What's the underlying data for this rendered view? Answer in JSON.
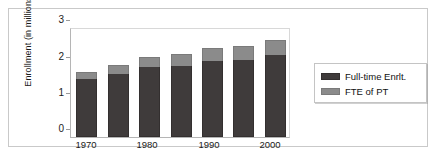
{
  "chart_data": {
    "type": "bar",
    "stacked": true,
    "title": "",
    "xlabel": "",
    "ylabel": "Enrollment (in millions)",
    "ylim": [
      0,
      3
    ],
    "yticks": [
      0,
      1,
      2,
      3
    ],
    "ytick_labels": [
      "0",
      "1",
      "2",
      "3"
    ],
    "grid": false,
    "legend_position": "right",
    "categories": [
      "1970",
      "1975",
      "1980",
      "1985",
      "1990",
      "1995",
      "2000"
    ],
    "xtick_labels": [
      "1970",
      "1980",
      "1990",
      "2000"
    ],
    "xtick_categories": [
      "1970",
      "1980",
      "1990",
      "2000"
    ],
    "series": [
      {
        "name": "Full-time Enrlt.",
        "color": "#3f3b3b",
        "values": [
          1.58,
          1.72,
          1.9,
          1.93,
          2.06,
          2.09,
          2.25
        ]
      },
      {
        "name": "FTE of PT",
        "color": "#8b8b8b",
        "values": [
          0.2,
          0.24,
          0.28,
          0.33,
          0.37,
          0.39,
          0.39
        ]
      }
    ],
    "totals": [
      1.78,
      1.96,
      2.18,
      2.26,
      2.43,
      2.48,
      2.64
    ]
  },
  "legend": {
    "items": [
      {
        "label": "Full-time Enrlt.",
        "color": "#3f3b3b",
        "swatch": "ft"
      },
      {
        "label": "FTE of PT",
        "color": "#8b8b8b",
        "swatch": "pt"
      }
    ]
  },
  "axis": {
    "y_title": "Enrollment (in millions)",
    "y_tick_0": "0",
    "y_tick_1": "1",
    "y_tick_2": "2",
    "y_tick_3": "3",
    "x_tick_0": "1970",
    "x_tick_1": "1980",
    "x_tick_2": "1990",
    "x_tick_3": "2000"
  },
  "colors": {
    "full_time": "#3f3b3b",
    "fte_part_time": "#8b8b8b",
    "frame": "#c9c9c9",
    "axis": "#b5b5b5",
    "background": "#ffffff"
  }
}
